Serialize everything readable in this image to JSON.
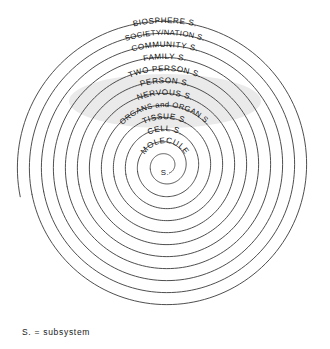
{
  "figure": {
    "type": "concentric-spiral-hierarchy",
    "title": "",
    "center": {
      "x": 165,
      "y": 166
    },
    "footnote": "S. = subsystem",
    "ink_color": "#3a3a3a",
    "text_color": "#151515",
    "highlight_color": "#d9d9d9",
    "background": "#ffffff"
  },
  "rings": [
    {
      "index": 1,
      "label": "BIOSPHERE S.",
      "radius": 148,
      "label_radius": 143,
      "level": "outermost",
      "highlighted": false
    },
    {
      "index": 2,
      "label": "SOCIETY/NATION  S.",
      "radius": 136,
      "label_radius": 131,
      "level": "2",
      "highlighted": false
    },
    {
      "index": 3,
      "label": "COMMUNITY  S.",
      "radius": 124,
      "label_radius": 119,
      "level": "3",
      "highlighted": false
    },
    {
      "index": 4,
      "label": "FAMILY S.",
      "radius": 112,
      "label_radius": 107,
      "level": "4",
      "highlighted": false
    },
    {
      "index": 5,
      "label": "TWO PERSON  S.",
      "radius": 100,
      "label_radius": 95,
      "level": "5",
      "highlighted": false
    },
    {
      "index": 6,
      "label": "PERSON S.",
      "radius": 88,
      "label_radius": 83,
      "level": "6",
      "highlighted": true
    },
    {
      "index": 7,
      "label": "NERVOUS S.",
      "radius": 76,
      "label_radius": 71,
      "level": "7",
      "highlighted": true
    },
    {
      "index": 8,
      "label": "ORGANS  and ORGAN  S.",
      "radius": 64,
      "label_radius": 59,
      "level": "8",
      "highlighted": false
    },
    {
      "index": 9,
      "label": "TISSUE S.",
      "radius": 52,
      "label_radius": 47,
      "level": "9",
      "highlighted": false
    },
    {
      "index": 10,
      "label": "CELL S.",
      "radius": 40,
      "label_radius": 35,
      "level": "10",
      "highlighted": false
    },
    {
      "index": 11,
      "label": "MOLECULE",
      "radius": 28,
      "label_radius": 23,
      "level": "11",
      "highlighted": false
    },
    {
      "index": 12,
      "label": "",
      "radius": 15,
      "label_radius": 0,
      "level": "innermost",
      "highlighted": false
    }
  ],
  "center_label": {
    "text": "S.",
    "x": 165,
    "y": 175
  },
  "legend": {
    "abbreviation": "S.",
    "expansion": "subsystem",
    "text": "S. = subsystem"
  }
}
